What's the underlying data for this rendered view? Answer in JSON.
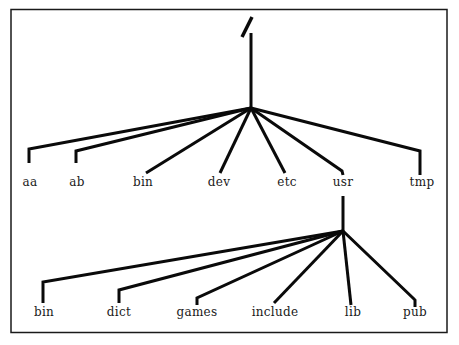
{
  "diagram": {
    "type": "tree",
    "root": {
      "label": "/",
      "children": [
        {
          "label": "aa"
        },
        {
          "label": "ab"
        },
        {
          "label": "bin"
        },
        {
          "label": "dev"
        },
        {
          "label": "etc"
        },
        {
          "label": "usr",
          "children": [
            {
              "label": "bin"
            },
            {
              "label": "dict"
            },
            {
              "label": "games"
            },
            {
              "label": "include"
            },
            {
              "label": "lib"
            },
            {
              "label": "pub"
            }
          ]
        },
        {
          "label": "tmp"
        }
      ]
    }
  },
  "labels": {
    "root": "/",
    "level1": [
      "aa",
      "ab",
      "bin",
      "dev",
      "etc",
      "usr",
      "tmp"
    ],
    "level2": [
      "bin",
      "dict",
      "games",
      "include",
      "lib",
      "pub"
    ]
  },
  "colors": {
    "line": "#0a0a0a",
    "text": "#1a1a1a",
    "background": "#ffffff"
  }
}
